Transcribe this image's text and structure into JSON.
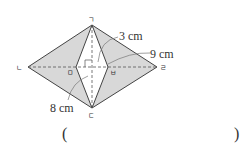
{
  "diagram": {
    "vertices": {
      "top": {
        "label": "ㄱ",
        "x": 92,
        "y": 25
      },
      "left": {
        "label": "ㄴ",
        "x": 28,
        "y": 67
      },
      "bottom": {
        "label": "ㄷ",
        "x": 92,
        "y": 108
      },
      "right": {
        "label": "ㄹ",
        "x": 157,
        "y": 67
      },
      "inner_left": {
        "label": "ㅁ",
        "x": 76,
        "y": 67
      },
      "inner_right": {
        "label": "ㅂ",
        "x": 108,
        "y": 67
      }
    },
    "measurements": {
      "half_inner_width": "3 cm",
      "half_diagonal_right": "9 cm",
      "half_diagonal_bottom": "8 cm"
    },
    "colors": {
      "fill": "#d8d8d8",
      "stroke": "#444444"
    }
  },
  "answer": {
    "open_paren": "(",
    "close_paren": ")"
  }
}
